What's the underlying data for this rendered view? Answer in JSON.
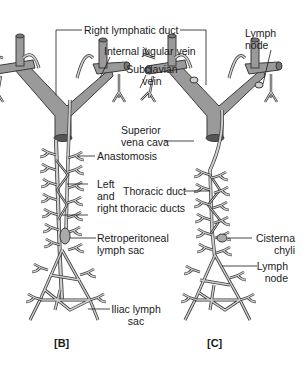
{
  "figure": {
    "colors": {
      "vessel_fill": "#9a9a9a",
      "vessel_stroke": "#3a3a3a",
      "lymph_fill": "#cfcfcf",
      "text": "#1a1a1a",
      "background": "#ffffff"
    },
    "panels": [
      {
        "id": "B",
        "label": "[B]"
      },
      {
        "id": "C",
        "label": "[C]"
      }
    ],
    "labels": {
      "right_lymphatic_duct": "Right lymphatic duct",
      "internal_jugular_vein": "Internal jugular vein",
      "subclavian_vein_1": "Subclavian",
      "subclavian_vein_2": "vein",
      "lymph_node_top_1": "Lymph",
      "lymph_node_top_2": "node",
      "superior_vena_cava_1": "Superior",
      "superior_vena_cava_2": "vena cava",
      "anastomosis": "Anastomosis",
      "thoracic_duct": "Thoracic duct",
      "left_right_thoracic_1": "Left",
      "left_right_thoracic_2": "and",
      "left_right_thoracic_3": "right thoracic ducts",
      "retroperitoneal_1": "Retroperitoneal",
      "retroperitoneal_2": "lymph sac",
      "cisterna_chyli_1": "Cisterna",
      "cisterna_chyli_2": "chyli",
      "lymph_node_bottom_1": "Lymph",
      "lymph_node_bottom_2": "node",
      "iliac_1": "Iliac lymph",
      "iliac_2": "sac"
    }
  }
}
